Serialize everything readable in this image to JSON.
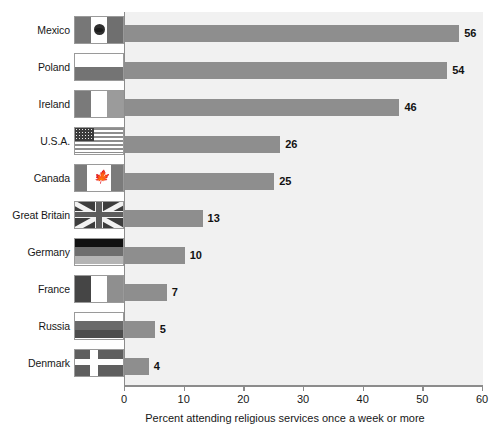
{
  "chart_data": {
    "type": "bar",
    "orientation": "horizontal",
    "title": "",
    "xlabel": "Percent attending religious services once a week or more",
    "ylabel": "",
    "xlim": [
      0,
      60
    ],
    "xticks": [
      0,
      10,
      20,
      30,
      40,
      50,
      60
    ],
    "grid": false,
    "legend": "none",
    "bar_color": "#8e8e8e",
    "plot_background": "#f1f1f1",
    "categories": [
      "Mexico",
      "Poland",
      "Ireland",
      "U.S.A.",
      "Canada",
      "Great Britain",
      "Germany",
      "France",
      "Russia",
      "Denmark"
    ],
    "values": [
      56,
      54,
      46,
      26,
      25,
      13,
      10,
      7,
      5,
      4
    ],
    "value_labels": [
      "56",
      "54",
      "46",
      "26",
      "25",
      "13",
      "10",
      "7",
      "5",
      "4"
    ],
    "category_icons": [
      "flag-mexico-icon",
      "flag-poland-icon",
      "flag-ireland-icon",
      "flag-usa-icon",
      "flag-canada-icon",
      "flag-great-britain-icon",
      "flag-germany-icon",
      "flag-france-icon",
      "flag-russia-icon",
      "flag-denmark-icon"
    ]
  },
  "axis": {
    "tick_labels": [
      "0",
      "10",
      "20",
      "30",
      "40",
      "50",
      "60"
    ],
    "title": "Percent attending religious services once a week or more"
  }
}
